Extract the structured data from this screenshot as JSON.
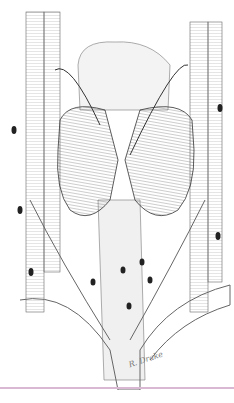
{
  "image": {
    "subject": "Anatomical pen-and-ink illustration of the thyroid gland with surrounding vessels and lymph nodes",
    "signature": "R. Drake",
    "colors": {
      "background": "#ffffff",
      "ink": "#2a2a2a",
      "rule": "#d9b8d4"
    }
  }
}
